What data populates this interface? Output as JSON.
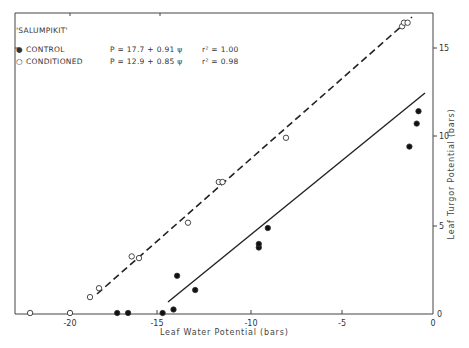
{
  "chart_data": {
    "type": "scatter",
    "title": "'SALUMPIKIT'",
    "xlabel": "Leaf Water Potential (bars)",
    "ylabel": "Leaf Turgor Potential (bars)",
    "xlim": [
      -22.5,
      0
    ],
    "ylim": [
      0,
      17.5
    ],
    "x_ticks": [
      "-20",
      "-15",
      "-10",
      "-5",
      "0"
    ],
    "y_ticks": [
      "0",
      "5",
      "10",
      "15"
    ],
    "grid": false,
    "legend_position": "upper-left",
    "series": [
      {
        "name": "CONTROL",
        "marker": "filled-circle",
        "equation": "P = 17.7 + 0.91 ψ",
        "r2": "r² = 1.00",
        "fit": {
          "intercept": 12.2,
          "slope": 0.87,
          "x_range": [
            -14.8,
            -0.3
          ],
          "style": "solid"
        },
        "points": [
          [
            -17.4,
            0
          ],
          [
            -16.8,
            0
          ],
          [
            -14.9,
            0
          ],
          [
            -14.3,
            0.2
          ],
          [
            -14.1,
            2.1
          ],
          [
            -13.1,
            1.3
          ],
          [
            -9.6,
            3.7
          ],
          [
            -9.6,
            3.9
          ],
          [
            -9.1,
            4.8
          ],
          [
            -1.3,
            9.4
          ],
          [
            -0.9,
            10.7
          ],
          [
            -0.8,
            11.4
          ]
        ],
        "points_note": "approximate; read from plot"
      },
      {
        "name": "CONDITIONED",
        "marker": "open-circle",
        "equation": "P = 12.9 + 0.85 ψ",
        "r2": "r² = 0.98",
        "fit": {
          "intercept": 17.7,
          "slope": 0.91,
          "x_range": [
            -18.5,
            -1.4
          ],
          "style": "dashed"
        },
        "points": [
          [
            -22.2,
            0
          ],
          [
            -20,
            0
          ],
          [
            -18.9,
            0.9
          ],
          [
            -18.4,
            1.4
          ],
          [
            -16.6,
            3.2
          ],
          [
            -16.2,
            3.1
          ],
          [
            -13.5,
            5.1
          ],
          [
            -11.8,
            7.4
          ],
          [
            -11.6,
            7.4
          ],
          [
            -8.1,
            9.9
          ],
          [
            -1.7,
            16.2
          ],
          [
            -1.6,
            16.4
          ],
          [
            -1.4,
            16.4
          ]
        ]
      }
    ]
  },
  "legend": {
    "title": "'SALUMPIKIT'",
    "items": [
      {
        "name": "CONTROL",
        "symbol": "●",
        "equation": "P  = 17.7 + 0.91 ψ",
        "r2": "r² = 1.00"
      },
      {
        "name": "CONDITIONED",
        "symbol": "○",
        "equation": "P  = 12.9 + 0.85 ψ",
        "r2": "r² = 0.98"
      }
    ]
  },
  "axes": {
    "xlabel": "Leaf  Water  Potential  (bars)",
    "ylabel": "Leaf  Turgor  Potential  (bars)",
    "x_ticks": [
      {
        "label": "-20",
        "px": 70
      },
      {
        "label": "-15",
        "px": 157
      },
      {
        "label": "-10",
        "px": 251
      },
      {
        "label": "-5",
        "px": 342
      },
      {
        "label": "0",
        "px": 433
      }
    ],
    "y_ticks": [
      {
        "label": "15",
        "py": 48
      },
      {
        "label": "10",
        "py": 136
      },
      {
        "label": "5",
        "py": 226
      },
      {
        "label": "0",
        "py": 313
      }
    ]
  },
  "colors": {
    "ink": "#222222",
    "background": "#ffffff"
  }
}
